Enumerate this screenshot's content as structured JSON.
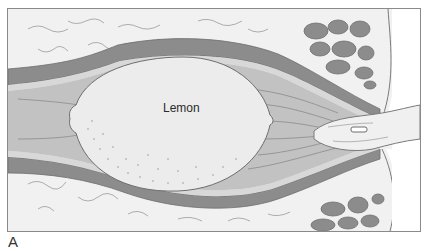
{
  "figure": {
    "panel_label": "A",
    "object_label": "Lemon",
    "colors": {
      "background": "#f2f2f2",
      "fat_tissue": "#f0f0f0",
      "muscle_wall": "#8c8c8c",
      "mucosa": "#b5b5b5",
      "lumen": "#c6c6c6",
      "lemon": "#ececec",
      "outline": "#6e6e6e"
    }
  }
}
